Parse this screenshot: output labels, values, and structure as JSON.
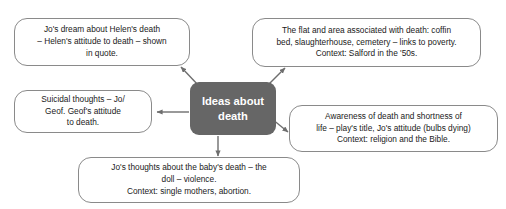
{
  "diagram": {
    "center": {
      "label": "Ideas about\ndeath",
      "fill_color": "#666666",
      "text_color": "#ffffff"
    },
    "branches": [
      {
        "id": "top-left",
        "text": "Jo's dream about Helen's death\n– Helen's attitude to death – shown\nin quote."
      },
      {
        "id": "top-right",
        "text": "The flat and area associated with death: coffin\nbed, slaughterhouse, cemetery – links to poverty.\nContext: Salford in the '50s."
      },
      {
        "id": "left",
        "text": "Suicidal thoughts – Jo/\nGeof. Geof's attitude\nto death."
      },
      {
        "id": "right",
        "text": "Awareness of death and shortness of\nlife – play's title, Jo's attitude (bulbs dying)\nContext: religion and the Bible."
      },
      {
        "id": "bottom",
        "text": "Jo's thoughts about the baby's death – the\ndoll – violence.\nContext: single mothers, abortion."
      }
    ],
    "connector_color": "#6e6e6e",
    "bubble_border_color": "#8a8a8a",
    "bubble_fill_color": "#ffffff",
    "background_color": "#ffffff"
  }
}
